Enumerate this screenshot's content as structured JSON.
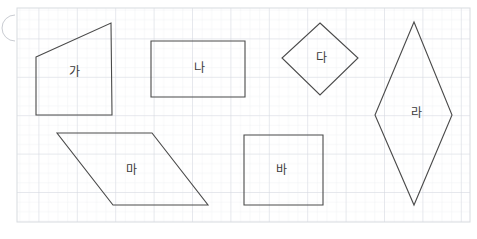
{
  "canvas": {
    "width": 477,
    "height": 239,
    "background": "#ffffff"
  },
  "grid": {
    "x": 17,
    "y": 8,
    "width": 453,
    "height": 214,
    "minor_spacing": 9.6,
    "major_spacing": 38.4,
    "minor_color": "#e4e7ec",
    "major_color": "#d2d6de",
    "border_color": "#d8dbe0",
    "visible": true
  },
  "corner_mark": {
    "name": "page-corner-arc",
    "cx": 2,
    "cy": 28,
    "r": 13,
    "color": "#c9ccd2",
    "visible": true
  },
  "style": {
    "stroke_color": "#4a4a4a",
    "stroke_width": 1.1,
    "fill": "none",
    "label_color": "#3a3a3a",
    "label_size": 12
  },
  "diagram": {
    "type": "quadrilateral-set",
    "count": 6,
    "shapes": [
      {
        "id": "shape-ga",
        "label": "가",
        "kind": "trapezoid",
        "points": "36,57 111,23 112,115 36,115",
        "label_x": 74,
        "label_y": 72
      },
      {
        "id": "shape-na",
        "label": "나",
        "kind": "rectangle",
        "points": "151,41 245,41 245,97 151,97",
        "label_x": 199,
        "label_y": 68
      },
      {
        "id": "shape-da",
        "label": "다",
        "kind": "square-rotated",
        "points": "320,23 358,58 320,95 282,58",
        "label_x": 321,
        "label_y": 58
      },
      {
        "id": "shape-ra",
        "label": "라",
        "kind": "rhombus",
        "points": "414,22 452,115 414,205 375,115",
        "label_x": 416,
        "label_y": 113
      },
      {
        "id": "shape-ma",
        "label": "마",
        "kind": "parallelogram",
        "points": "57,133 152,133 208,205 113,205",
        "label_x": 131,
        "label_y": 170
      },
      {
        "id": "shape-ba",
        "label": "바",
        "kind": "square",
        "points": "244,135 323,135 323,205 244,205",
        "label_x": 281,
        "label_y": 170
      }
    ]
  }
}
